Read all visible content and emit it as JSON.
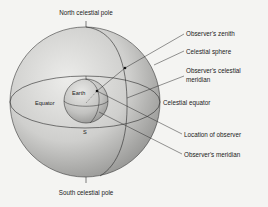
{
  "diagram": {
    "title_top": "North celestial pole",
    "title_bottom": "South celestial pole",
    "inner_labels": {
      "earth": "Earth",
      "equator": "Equator",
      "south": "S"
    },
    "callouts": [
      {
        "id": "zenith",
        "label": "Observer's zenith"
      },
      {
        "id": "celestial-sphere",
        "label": "Celestial sphere"
      },
      {
        "id": "celestial-meridian-line1",
        "label": "Observer's celestial"
      },
      {
        "id": "celestial-meridian-line2",
        "label": "meridian"
      },
      {
        "id": "celestial-equator",
        "label": "Celestial equator"
      },
      {
        "id": "location",
        "label": "Location of observer"
      },
      {
        "id": "meridian",
        "label": "Observer's meridian"
      }
    ],
    "colors": {
      "background": "#f4f4f2",
      "sphere_light": "#e6e6e4",
      "sphere_dark": "#8e8e8c",
      "earth_light": "#dcdcda",
      "earth_dark": "#9a9a98",
      "line": "#2a2a2a"
    }
  }
}
